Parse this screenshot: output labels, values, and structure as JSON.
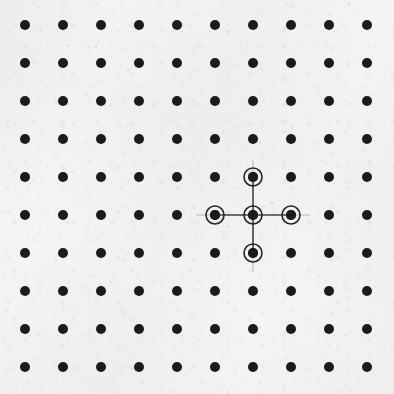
{
  "figure": {
    "type": "lattice-diagram",
    "width": 394,
    "height": 394,
    "background_color": "#f5f4f2",
    "texture": "paper-grain"
  },
  "lattice": {
    "columns": 10,
    "rows": 10,
    "spacing_px": 38,
    "origin_x": 25,
    "origin_y": 25,
    "dot_radius_px": 5,
    "dot_color": "#1b1b1b",
    "total_dots": 100
  },
  "highlight": {
    "shape": "plus",
    "ring_outer_radius_px": 9,
    "ring_stroke_width_px": 1.6,
    "ring_color": "#252525",
    "bond_color": "#4a4a4a",
    "bond_width_px": 1.6,
    "center_label": "center-node",
    "center": {
      "col": 7,
      "row": 6,
      "x": 253,
      "y": 215
    },
    "nodes": [
      {
        "name": "center-node",
        "col": 7,
        "row": 6,
        "x": 253,
        "y": 215
      },
      {
        "name": "north-node",
        "col": 7,
        "row": 5,
        "x": 253,
        "y": 177
      },
      {
        "name": "south-node",
        "col": 7,
        "row": 7,
        "x": 253,
        "y": 253
      },
      {
        "name": "west-node",
        "col": 6,
        "row": 6,
        "x": 215,
        "y": 215
      },
      {
        "name": "east-node",
        "col": 8,
        "row": 6,
        "x": 291,
        "y": 215
      }
    ],
    "bonds": [
      {
        "name": "bond-center-north",
        "x1": 253,
        "y1": 215,
        "x2": 253,
        "y2": 177
      },
      {
        "name": "bond-center-south",
        "x1": 253,
        "y1": 215,
        "x2": 253,
        "y2": 253
      },
      {
        "name": "bond-center-west",
        "x1": 253,
        "y1": 215,
        "x2": 215,
        "y2": 215
      },
      {
        "name": "bond-center-east",
        "x1": 253,
        "y1": 215,
        "x2": 291,
        "y2": 215
      }
    ]
  },
  "crosshair": {
    "color": "#b8b6b3",
    "stroke_width_px": 1,
    "vertical": {
      "x": 253,
      "y1": 160,
      "y2": 272
    },
    "horizontal": {
      "y": 215,
      "x1": 196,
      "x2": 310
    }
  },
  "specks": [
    {
      "name": "paper-speck-right-of-center",
      "x": 272,
      "y": 203,
      "r": 1.1
    },
    {
      "name": "paper-speck-upper-left",
      "x": 96,
      "y": 47,
      "r": 0.9
    }
  ]
}
